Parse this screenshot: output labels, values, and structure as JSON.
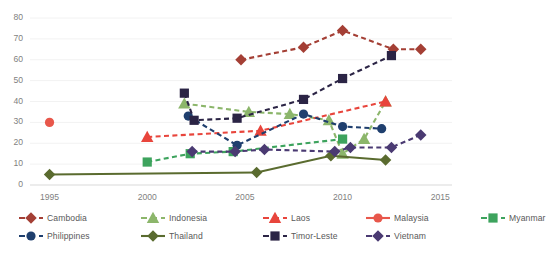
{
  "chart_data": {
    "type": "line",
    "title": "",
    "xlabel": "",
    "ylabel": "",
    "xlim": [
      1994,
      2015.6
    ],
    "ylim": [
      0,
      80
    ],
    "grid": true,
    "grid_color": "#f2f2f2",
    "legend_position": "bottom",
    "x_ticks": [
      "1995",
      "2000",
      "2005",
      "2010",
      "2015"
    ],
    "x_tick_values": [
      1995,
      2000,
      2005,
      2010,
      2015
    ],
    "y_ticks": [
      "0",
      "10",
      "20",
      "30",
      "40",
      "50",
      "60",
      "70",
      "80"
    ],
    "y_tick_values": [
      0,
      10,
      20,
      30,
      40,
      50,
      60,
      70,
      80
    ],
    "series": [
      {
        "name": "Cambodia",
        "color": "#A43F35",
        "marker": "diamond",
        "dash": "dashed",
        "points": [
          [
            2004.8,
            60
          ],
          [
            2008,
            66
          ],
          [
            2010,
            74
          ],
          [
            2012.6,
            65
          ],
          [
            2014,
            65
          ]
        ]
      },
      {
        "name": "Indonesia",
        "color": "#8CB66B",
        "marker": "triangle",
        "dash": "dashed",
        "points": [
          [
            2001.9,
            39
          ],
          [
            2005.2,
            35
          ],
          [
            2007.3,
            34
          ],
          [
            2009.3,
            31
          ],
          [
            2010,
            15
          ],
          [
            2011.1,
            22
          ],
          [
            2012.2,
            40
          ]
        ]
      },
      {
        "name": "Laos",
        "color": "#E8453C",
        "marker": "triangle",
        "dash": "dashed",
        "points": [
          [
            2000,
            23
          ],
          [
            2005.8,
            26
          ],
          [
            2012.2,
            40
          ]
        ]
      },
      {
        "name": "Malaysia",
        "color": "#E8574B",
        "marker": "circle",
        "dash": "solid",
        "points": [
          [
            1995,
            30
          ]
        ]
      },
      {
        "name": "Myanmar",
        "color": "#3DA35D",
        "marker": "square",
        "dash": "dashed",
        "points": [
          [
            2000,
            11
          ],
          [
            2002.2,
            15
          ],
          [
            2004.4,
            16
          ],
          [
            2010,
            22
          ]
        ]
      },
      {
        "name": "Philippines",
        "color": "#1F3F6E",
        "marker": "circle",
        "dash": "dashed",
        "points": [
          [
            2002.1,
            33
          ],
          [
            2004.6,
            19
          ],
          [
            2008,
            34
          ],
          [
            2010,
            28
          ],
          [
            2012,
            27
          ]
        ]
      },
      {
        "name": "Thailand",
        "color": "#5A6B2F",
        "marker": "diamond",
        "dash": "solid",
        "points": [
          [
            1995,
            5
          ],
          [
            2005.6,
            6
          ],
          [
            2009.4,
            14
          ],
          [
            2012.2,
            12
          ]
        ]
      },
      {
        "name": "Timor-Leste",
        "color": "#2B2445",
        "marker": "square",
        "dash": "dashed",
        "points": [
          [
            2001.9,
            44
          ],
          [
            2002.4,
            31
          ],
          [
            2004.6,
            32
          ],
          [
            2008,
            41
          ],
          [
            2010,
            51
          ],
          [
            2012.5,
            62
          ]
        ]
      },
      {
        "name": "Vietnam",
        "color": "#4A3A72",
        "marker": "diamond",
        "dash": "dashed",
        "points": [
          [
            2002.3,
            16
          ],
          [
            2004.5,
            16
          ],
          [
            2006,
            17
          ],
          [
            2009.6,
            16
          ],
          [
            2010.4,
            18
          ],
          [
            2012.5,
            18
          ],
          [
            2014,
            24
          ]
        ]
      }
    ]
  },
  "legend": {
    "row0": [
      {
        "label": "Cambodia",
        "color": "#A43F35",
        "marker": "diamond",
        "dash": "dashed"
      },
      {
        "label": "Indonesia",
        "color": "#8CB66B",
        "marker": "triangle",
        "dash": "dashed"
      },
      {
        "label": "Laos",
        "color": "#E8453C",
        "marker": "triangle",
        "dash": "dashed"
      },
      {
        "label": "Malaysia",
        "color": "#E8574B",
        "marker": "circle",
        "dash": "solid"
      },
      {
        "label": "Myanmar",
        "color": "#3DA35D",
        "marker": "square",
        "dash": "dashed"
      }
    ],
    "row1": [
      {
        "label": "Philippines",
        "color": "#1F3F6E",
        "marker": "circle",
        "dash": "dashed"
      },
      {
        "label": "Thailand",
        "color": "#5A6B2F",
        "marker": "diamond",
        "dash": "solid"
      },
      {
        "label": "Timor-Leste",
        "color": "#2B2445",
        "marker": "square",
        "dash": "dashed"
      },
      {
        "label": "Vietnam",
        "color": "#4A3A72",
        "marker": "diamond",
        "dash": "dashed"
      }
    ],
    "row0_offsets": [
      18,
      140,
      262,
      365,
      480
    ],
    "row1_offsets": [
      18,
      140,
      262,
      365
    ]
  },
  "plot": {
    "left": 30,
    "right": 452,
    "top": 18,
    "bottom": 185
  }
}
